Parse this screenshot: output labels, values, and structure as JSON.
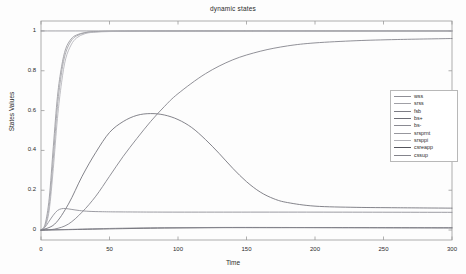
{
  "chart_data": {
    "type": "line",
    "title": "dynamic states",
    "xlabel": "Time",
    "ylabel": "States Values",
    "xlim": [
      0,
      300
    ],
    "ylim": [
      -0.05,
      1.05
    ],
    "xticks": [
      0,
      50,
      100,
      150,
      200,
      250,
      300
    ],
    "yticks": [
      0,
      0.2,
      0.4,
      0.6,
      0.8,
      1
    ],
    "xtick_labels": [
      "0",
      "50",
      "100",
      "150",
      "200",
      "250",
      "300"
    ],
    "ytick_labels": [
      "0",
      "0.2",
      "0.4",
      "0.6",
      "0.8",
      "1"
    ],
    "grid": false,
    "legend_position": "right",
    "series": [
      {
        "name": "wss",
        "color": "#8f8f96",
        "shape": "constant",
        "points": [
          [
            0,
            1.0
          ],
          [
            300,
            1.0
          ]
        ]
      },
      {
        "name": "srss",
        "color": "#a0a0a6",
        "shape": "fast-sigmoid",
        "points": [
          [
            0,
            0.0
          ],
          [
            3,
            0.02
          ],
          [
            6,
            0.12
          ],
          [
            9,
            0.36
          ],
          [
            12,
            0.62
          ],
          [
            15,
            0.79
          ],
          [
            18,
            0.89
          ],
          [
            22,
            0.95
          ],
          [
            26,
            0.975
          ],
          [
            32,
            0.99
          ],
          [
            40,
            0.996
          ],
          [
            60,
            0.999
          ],
          [
            120,
            1.0
          ],
          [
            300,
            1.0
          ]
        ]
      },
      {
        "name": "fsb",
        "color": "#7d7d85",
        "shape": "slow-sigmoid",
        "points": [
          [
            0,
            0.0
          ],
          [
            10,
            0.005
          ],
          [
            20,
            0.03
          ],
          [
            30,
            0.09
          ],
          [
            40,
            0.17
          ],
          [
            50,
            0.27
          ],
          [
            60,
            0.37
          ],
          [
            70,
            0.46
          ],
          [
            80,
            0.545
          ],
          [
            90,
            0.62
          ],
          [
            100,
            0.685
          ],
          [
            120,
            0.785
          ],
          [
            140,
            0.855
          ],
          [
            160,
            0.898
          ],
          [
            180,
            0.925
          ],
          [
            200,
            0.94
          ],
          [
            230,
            0.951
          ],
          [
            260,
            0.957
          ],
          [
            300,
            0.962
          ]
        ]
      },
      {
        "name": "bs+",
        "color": "#6e6e76",
        "shape": "rise-peak-decay",
        "points": [
          [
            0,
            0.0
          ],
          [
            10,
            0.03
          ],
          [
            20,
            0.13
          ],
          [
            30,
            0.27
          ],
          [
            40,
            0.39
          ],
          [
            50,
            0.49
          ],
          [
            60,
            0.545
          ],
          [
            70,
            0.576
          ],
          [
            80,
            0.585
          ],
          [
            90,
            0.578
          ],
          [
            100,
            0.555
          ],
          [
            110,
            0.515
          ],
          [
            120,
            0.455
          ],
          [
            130,
            0.385
          ],
          [
            140,
            0.31
          ],
          [
            150,
            0.243
          ],
          [
            160,
            0.191
          ],
          [
            170,
            0.157
          ],
          [
            180,
            0.138
          ],
          [
            200,
            0.12
          ],
          [
            230,
            0.114
          ],
          [
            260,
            0.112
          ],
          [
            300,
            0.11
          ]
        ]
      },
      {
        "name": "bs-",
        "color": "#8a8a92",
        "shape": "early-bump-plateau",
        "points": [
          [
            0,
            0.0
          ],
          [
            3,
            0.015
          ],
          [
            6,
            0.045
          ],
          [
            9,
            0.075
          ],
          [
            12,
            0.098
          ],
          [
            15,
            0.107
          ],
          [
            18,
            0.108
          ],
          [
            22,
            0.104
          ],
          [
            28,
            0.098
          ],
          [
            35,
            0.094
          ],
          [
            45,
            0.092
          ],
          [
            60,
            0.091
          ],
          [
            100,
            0.09
          ],
          [
            200,
            0.09
          ],
          [
            300,
            0.089
          ]
        ]
      },
      {
        "name": "srsprnt",
        "color": "#97979d",
        "shape": "fast-sigmoid",
        "points": [
          [
            0,
            0.0
          ],
          [
            3,
            0.03
          ],
          [
            6,
            0.16
          ],
          [
            9,
            0.42
          ],
          [
            12,
            0.67
          ],
          [
            15,
            0.82
          ],
          [
            18,
            0.91
          ],
          [
            22,
            0.96
          ],
          [
            26,
            0.98
          ],
          [
            32,
            0.992
          ],
          [
            40,
            0.997
          ],
          [
            60,
            0.999
          ],
          [
            120,
            1.0
          ],
          [
            300,
            1.0
          ]
        ]
      },
      {
        "name": "srsppi",
        "color": "#b2b2b8",
        "shape": "fast-sigmoid",
        "points": [
          [
            0,
            0.0
          ],
          [
            3,
            0.018
          ],
          [
            6,
            0.1
          ],
          [
            9,
            0.31
          ],
          [
            12,
            0.56
          ],
          [
            15,
            0.74
          ],
          [
            18,
            0.86
          ],
          [
            22,
            0.93
          ],
          [
            26,
            0.965
          ],
          [
            32,
            0.986
          ],
          [
            40,
            0.994
          ],
          [
            60,
            0.998
          ],
          [
            120,
            1.0
          ],
          [
            300,
            1.0
          ]
        ]
      },
      {
        "name": "csreapp",
        "color": "#55555d",
        "shape": "near-zero",
        "points": [
          [
            0,
            0.0
          ],
          [
            20,
            0.002
          ],
          [
            50,
            0.006
          ],
          [
            90,
            0.01
          ],
          [
            130,
            0.012
          ],
          [
            170,
            0.012
          ],
          [
            220,
            0.012
          ],
          [
            300,
            0.011
          ]
        ]
      },
      {
        "name": "cssup",
        "color": "#84848c",
        "shape": "near-zero",
        "points": [
          [
            0,
            0.0
          ],
          [
            20,
            0.003
          ],
          [
            50,
            0.008
          ],
          [
            90,
            0.012
          ],
          [
            130,
            0.013
          ],
          [
            170,
            0.013
          ],
          [
            220,
            0.012
          ],
          [
            300,
            0.011
          ]
        ]
      }
    ]
  },
  "legend": {
    "entries": [
      {
        "label": "wss"
      },
      {
        "label": "srss"
      },
      {
        "label": "fsb"
      },
      {
        "label": "bs+"
      },
      {
        "label": "bs-"
      },
      {
        "label": "srsprnt"
      },
      {
        "label": "srsppi"
      },
      {
        "label": "csreapp"
      },
      {
        "label": "cssup"
      }
    ]
  },
  "axes": {
    "frame_color": "#9a9a9a",
    "text_color": "#2a2a2a"
  }
}
